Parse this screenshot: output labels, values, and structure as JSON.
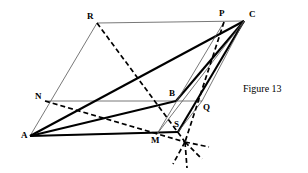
{
  "figure": {
    "caption": "Figure 13",
    "caption_pos": {
      "x": 243,
      "y": 84
    },
    "background_color": "#ffffff",
    "ink_color": "#000000",
    "thin_color": "#555555",
    "points": {
      "A": {
        "x": 30,
        "y": 136,
        "label": "A",
        "label_x": 21,
        "label_y": 131
      },
      "R": {
        "x": 97,
        "y": 23,
        "label": "R",
        "label_x": 87,
        "label_y": 12
      },
      "C": {
        "x": 244,
        "y": 21,
        "label": "C",
        "label_x": 249,
        "label_y": 10
      },
      "P": {
        "x": 224,
        "y": 22,
        "label": "P",
        "label_x": 219,
        "label_y": 9
      },
      "N": {
        "x": 45,
        "y": 101,
        "label": "N",
        "label_x": 35,
        "label_y": 92
      },
      "Q": {
        "x": 202,
        "y": 101,
        "label": "Q",
        "label_x": 203,
        "label_y": 103
      },
      "B": {
        "x": 176,
        "y": 101,
        "label": "B",
        "label_x": 169,
        "label_y": 89
      },
      "M": {
        "x": 157,
        "y": 134,
        "label": "M",
        "label_x": 151,
        "label_y": 136
      },
      "S": {
        "x": 178,
        "y": 132,
        "label": "S",
        "label_x": 174,
        "label_y": 120
      },
      "X": {
        "x": 185,
        "y": 142,
        "label": "",
        "label_x": 0,
        "label_y": 0
      }
    },
    "segments": [
      {
        "name": "segment-R-C",
        "from": "R",
        "to": "C",
        "style": "thin"
      },
      {
        "name": "segment-A-R",
        "from": "A",
        "to": "R",
        "style": "thin"
      },
      {
        "name": "segment-N-Q",
        "from": "N",
        "to": "Q",
        "style": "thin"
      },
      {
        "name": "segment-A-M",
        "from": "A",
        "to": "S",
        "style": "thin"
      },
      {
        "name": "segment-A-C",
        "from": "A",
        "to": "C",
        "style": "thick"
      },
      {
        "name": "segment-A-B",
        "from": "A",
        "to": "B",
        "style": "thick"
      },
      {
        "name": "segment-B-C",
        "from": "B",
        "to": "C",
        "style": "thick"
      },
      {
        "name": "segment-A-S",
        "from": "A",
        "to": "S",
        "style": "thick"
      },
      {
        "name": "segment-S-C",
        "from": "S",
        "to": "C",
        "style": "thick"
      },
      {
        "name": "segment-M-C",
        "from": "M",
        "to": "C",
        "style": "thin"
      },
      {
        "name": "segment-S-Q",
        "from": "S",
        "to": "Q",
        "style": "thin"
      },
      {
        "name": "segment-Q-C",
        "from": "Q",
        "to": "C",
        "style": "thin"
      },
      {
        "name": "segment-M-P",
        "from": "M",
        "to": "P",
        "style": "thin"
      },
      {
        "name": "segment-R-X",
        "from": "R",
        "to": "X",
        "style": "dashed"
      },
      {
        "name": "segment-N-X",
        "from": "N",
        "to": "X",
        "style": "dashed"
      },
      {
        "name": "segment-P-X",
        "from": "P",
        "to": "X",
        "style": "dashed"
      }
    ],
    "star_rays": [
      {
        "name": "star-ray-down-left",
        "dx": -12,
        "dy": 22
      },
      {
        "name": "star-ray-down",
        "dx": 2,
        "dy": 26
      },
      {
        "name": "star-ray-right",
        "dx": 24,
        "dy": 5
      },
      {
        "name": "star-ray-down-right",
        "dx": 17,
        "dy": 17
      }
    ]
  }
}
